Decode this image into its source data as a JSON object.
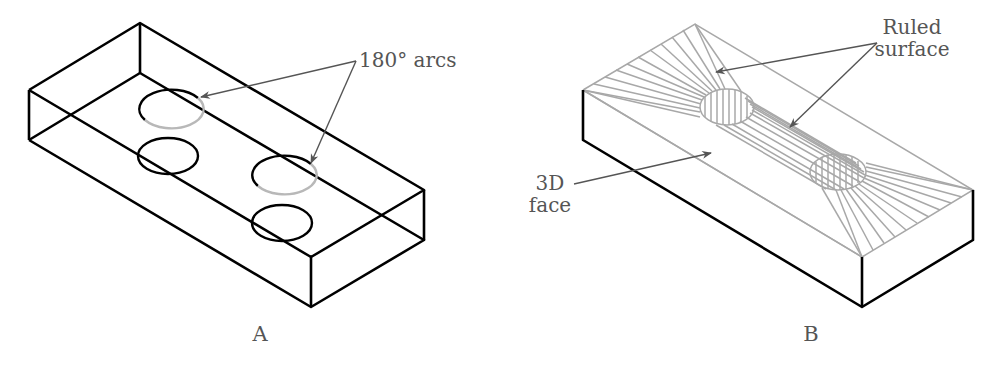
{
  "figures": [
    {
      "id": "A",
      "caption": "A",
      "callouts": [
        {
          "text": "180° arcs"
        }
      ]
    },
    {
      "id": "B",
      "caption": "B",
      "callouts": [
        {
          "line1": "Ruled",
          "line2": "surface"
        },
        {
          "line1": "3D",
          "line2": "face"
        }
      ]
    }
  ],
  "colors": {
    "edge": "#000000",
    "hidden_arc": "#b8b8b8",
    "ruled_lines": "#a8a8a8",
    "leader": "#555555",
    "text": "#555555"
  }
}
